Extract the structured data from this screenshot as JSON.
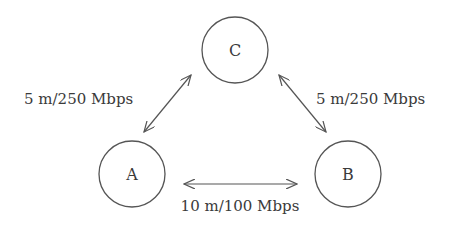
{
  "diagram": {
    "type": "network-topology",
    "nodes": [
      {
        "id": "C",
        "label": "C",
        "cx": 235,
        "cy": 50,
        "r": 33
      },
      {
        "id": "A",
        "label": "A",
        "cx": 132,
        "cy": 174,
        "r": 33
      },
      {
        "id": "B",
        "label": "B",
        "cx": 348,
        "cy": 174,
        "r": 33
      }
    ],
    "edges": [
      {
        "from": "A",
        "to": "C",
        "label": "5 m/250 Mbps",
        "bidirectional": true
      },
      {
        "from": "C",
        "to": "B",
        "label": "5 m/250 Mbps",
        "bidirectional": true
      },
      {
        "from": "A",
        "to": "B",
        "label": "10 m/100 Mbps",
        "bidirectional": true
      }
    ],
    "colors": {
      "stroke": "#555555",
      "text": "#3a3a3a",
      "background": "#ffffff"
    }
  }
}
